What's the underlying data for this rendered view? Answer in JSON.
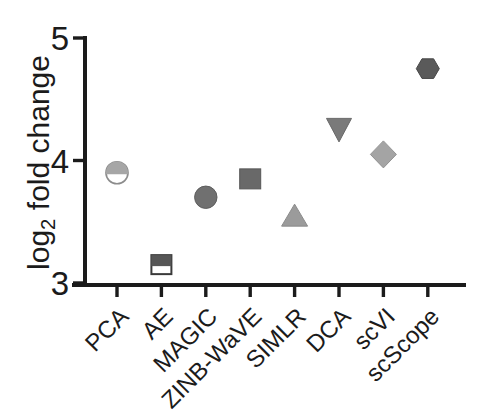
{
  "figure": {
    "width": 489,
    "height": 412,
    "background": "#ffffff"
  },
  "colors": {
    "axis": "#1b1b1b",
    "text": "#1b1b1b",
    "background": "#ffffff"
  },
  "chart_data": {
    "type": "scatter",
    "title": "",
    "xlabel": "",
    "ylabel": "log2 fold change",
    "ylabel_rich": {
      "pre": "log",
      "sub": "2",
      "post": " fold change"
    },
    "ylim": [
      3,
      5
    ],
    "yticks": [
      5,
      4,
      3
    ],
    "grid": false,
    "legend": "none",
    "categories": [
      "PCA",
      "AE",
      "MAGIC",
      "ZINB-WaVE",
      "SIMLR",
      "DCA",
      "scVI",
      "scScope"
    ],
    "series": [
      {
        "name": "log2 fold change by method",
        "points": [
          {
            "category": "PCA",
            "value": 3.9,
            "marker": "circle-half-filled",
            "fill": "#a6a6a6",
            "open_fill": "#ffffff",
            "stroke": "#8c8c8c"
          },
          {
            "category": "AE",
            "value": 3.15,
            "marker": "square-half-filled",
            "fill": "#565656",
            "open_fill": "#ffffff",
            "stroke": "#3a3a3a"
          },
          {
            "category": "MAGIC",
            "value": 3.7,
            "marker": "circle",
            "fill": "#707070",
            "stroke": "#5e5e5e"
          },
          {
            "category": "ZINB-WaVE",
            "value": 3.85,
            "marker": "square",
            "fill": "#696969",
            "stroke": "#575757"
          },
          {
            "category": "SIMLR",
            "value": 3.55,
            "marker": "triangle-up",
            "fill": "#9b9b9b",
            "stroke": "#8a8a8a"
          },
          {
            "category": "DCA",
            "value": 4.25,
            "marker": "triangle-down",
            "fill": "#7a7a7a",
            "stroke": "#696969"
          },
          {
            "category": "scVI",
            "value": 4.05,
            "marker": "diamond",
            "fill": "#a4a4a4",
            "stroke": "#929292"
          },
          {
            "category": "scScope",
            "value": 4.75,
            "marker": "hexagon",
            "fill": "#5a5a5a",
            "stroke": "#484848"
          }
        ]
      }
    ]
  }
}
